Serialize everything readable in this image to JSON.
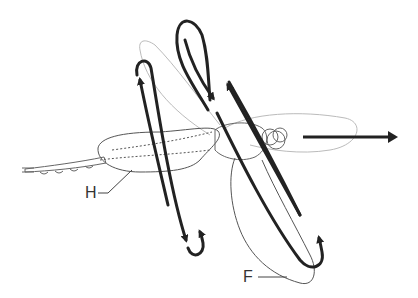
{
  "figure": {
    "labels": {
      "hindwing": "H",
      "forewing": "F"
    },
    "flight_direction_arrow": "right",
    "colors": {
      "stroke_path": "#222222",
      "body_outline": "#555555",
      "wing_outline_light": "#bbbbbb",
      "label_text": "#333333"
    }
  }
}
